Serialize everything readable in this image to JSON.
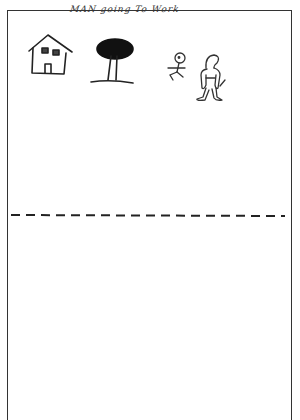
{
  "drawing": {
    "title": "MAN going To Work",
    "figures": [
      "house",
      "tree",
      "small-stick-figure",
      "man"
    ],
    "divider": "dashed-line",
    "colors": {
      "ink": "#222222",
      "paper": "#ffffff",
      "border": "#333333"
    }
  }
}
